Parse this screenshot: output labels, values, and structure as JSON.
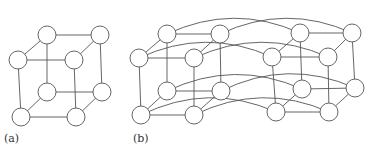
{
  "figure": {
    "panels": [
      {
        "id": "a",
        "label": "(a)",
        "description": "3-dimensional hypercube (cube) with 8 nodes",
        "nodes": [
          {
            "id": "a0",
            "x": 18,
            "y": 60
          },
          {
            "id": "a1",
            "x": 74,
            "y": 60
          },
          {
            "id": "a2",
            "x": 47,
            "y": 35
          },
          {
            "id": "a3",
            "x": 100,
            "y": 35
          },
          {
            "id": "a4",
            "x": 21,
            "y": 117
          },
          {
            "id": "a5",
            "x": 76,
            "y": 117
          },
          {
            "id": "a6",
            "x": 47,
            "y": 92
          },
          {
            "id": "a7",
            "x": 102,
            "y": 92
          }
        ],
        "edges": [
          [
            "a0",
            "a1"
          ],
          [
            "a2",
            "a3"
          ],
          [
            "a0",
            "a2"
          ],
          [
            "a1",
            "a3"
          ],
          [
            "a4",
            "a5"
          ],
          [
            "a6",
            "a7"
          ],
          [
            "a4",
            "a6"
          ],
          [
            "a5",
            "a7"
          ],
          [
            "a0",
            "a4"
          ],
          [
            "a1",
            "a5"
          ],
          [
            "a2",
            "a6"
          ],
          [
            "a3",
            "a7"
          ]
        ]
      },
      {
        "id": "b",
        "label": "(b)",
        "description": "4-dimensional hypercube built from two 3-cubes with corresponding nodes joined by arcs",
        "nodes": [
          {
            "id": "b0",
            "x": 139,
            "y": 58
          },
          {
            "id": "b1",
            "x": 194,
            "y": 58
          },
          {
            "id": "b2",
            "x": 167,
            "y": 34
          },
          {
            "id": "b3",
            "x": 220,
            "y": 34
          },
          {
            "id": "b4",
            "x": 141,
            "y": 115
          },
          {
            "id": "b5",
            "x": 194,
            "y": 115
          },
          {
            "id": "b6",
            "x": 167,
            "y": 91
          },
          {
            "id": "b7",
            "x": 221,
            "y": 91
          },
          {
            "id": "c0",
            "x": 272,
            "y": 57
          },
          {
            "id": "c1",
            "x": 328,
            "y": 57
          },
          {
            "id": "c2",
            "x": 300,
            "y": 33
          },
          {
            "id": "c3",
            "x": 352,
            "y": 33
          },
          {
            "id": "c4",
            "x": 276,
            "y": 112
          },
          {
            "id": "c5",
            "x": 329,
            "y": 112
          },
          {
            "id": "c6",
            "x": 302,
            "y": 89
          },
          {
            "id": "c7",
            "x": 355,
            "y": 88
          }
        ],
        "edges": [
          [
            "b0",
            "b1"
          ],
          [
            "b2",
            "b3"
          ],
          [
            "b0",
            "b2"
          ],
          [
            "b1",
            "b3"
          ],
          [
            "b4",
            "b5"
          ],
          [
            "b6",
            "b7"
          ],
          [
            "b4",
            "b6"
          ],
          [
            "b5",
            "b7"
          ],
          [
            "b0",
            "b4"
          ],
          [
            "b1",
            "b5"
          ],
          [
            "b2",
            "b6"
          ],
          [
            "b3",
            "b7"
          ],
          [
            "c0",
            "c1"
          ],
          [
            "c2",
            "c3"
          ],
          [
            "c0",
            "c2"
          ],
          [
            "c1",
            "c3"
          ],
          [
            "c4",
            "c5"
          ],
          [
            "c6",
            "c7"
          ],
          [
            "c4",
            "c6"
          ],
          [
            "c5",
            "c7"
          ],
          [
            "c0",
            "c4"
          ],
          [
            "c1",
            "c5"
          ],
          [
            "c2",
            "c6"
          ],
          [
            "c3",
            "c7"
          ]
        ],
        "arcs": [
          [
            "b0",
            "c0"
          ],
          [
            "b1",
            "c1"
          ],
          [
            "b2",
            "c2"
          ],
          [
            "b3",
            "c3"
          ],
          [
            "b4",
            "c4"
          ],
          [
            "b5",
            "c5"
          ],
          [
            "b6",
            "c6"
          ],
          [
            "b7",
            "c7"
          ]
        ]
      }
    ],
    "node_radius": 9,
    "stroke_color": "#555555"
  }
}
